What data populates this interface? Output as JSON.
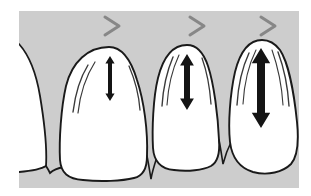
{
  "figure": {
    "kind": "dental-illustration",
    "width": 311,
    "height": 196,
    "background_color": "#ffffff",
    "plate_color": "#cdcdcd",
    "tooth_fill": "#ffffff",
    "outline_color": "#1a1a1a",
    "arrow_color": "#141414",
    "chevron_color": "#878787",
    "plate": {
      "x": 19,
      "y": 11,
      "width": 280,
      "height": 177
    }
  },
  "markers": {
    "chevron_glyph": ">",
    "items": [
      {
        "id": "chevron-1",
        "label": ">",
        "x": 112,
        "y": 26
      },
      {
        "id": "chevron-2",
        "label": ">",
        "x": 197,
        "y": 26
      },
      {
        "id": "chevron-3",
        "label": ">",
        "x": 268,
        "y": 26
      }
    ]
  },
  "teeth": [
    {
      "id": "tooth-partial-left",
      "name": "partial-tooth-left",
      "position": "left-edge",
      "recession_stage": "none",
      "has_arrow": false
    },
    {
      "id": "tooth-1",
      "name": "tooth-mild",
      "position": "first",
      "recession_stage": "mild",
      "has_arrow": true,
      "arrow": {
        "id": "arrow-1",
        "x": 110,
        "top": 56,
        "bottom": 101,
        "length": 45,
        "stroke": 4
      }
    },
    {
      "id": "tooth-2",
      "name": "tooth-moderate",
      "position": "second",
      "recession_stage": "moderate",
      "has_arrow": true,
      "arrow": {
        "id": "arrow-2",
        "x": 187,
        "top": 54,
        "bottom": 110,
        "length": 56,
        "stroke": 6
      }
    },
    {
      "id": "tooth-3",
      "name": "tooth-severe",
      "position": "third",
      "recession_stage": "severe",
      "has_arrow": true,
      "arrow": {
        "id": "arrow-3",
        "x": 261,
        "top": 48,
        "bottom": 128,
        "length": 80,
        "stroke": 8
      }
    }
  ]
}
